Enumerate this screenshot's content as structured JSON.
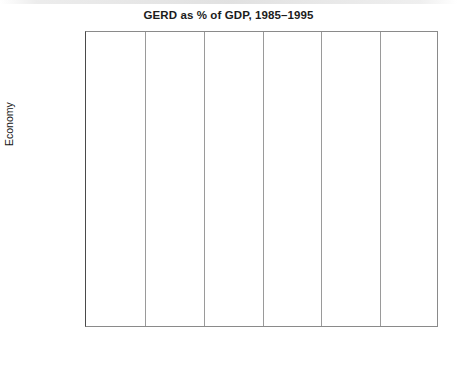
{
  "chart_data": {
    "type": "bar",
    "orientation": "horizontal",
    "title": "GERD as % of GDP, 1985–1995",
    "xlabel": "",
    "ylabel": "Economy",
    "xlim": [
      0,
      3
    ],
    "xticks": [
      0,
      0.5,
      1,
      1.5,
      2,
      2.5,
      3
    ],
    "xtick_labels": [
      "0",
      "0.5",
      "1",
      "1.5",
      "2",
      "2.5",
      "3"
    ],
    "grid": "vertical",
    "legend": "none",
    "categories": [
      "Japan",
      "Korea",
      "US",
      "UK",
      "Israel",
      "Chinese\nTaipei",
      "Australia",
      "Singapore",
      "New\nZealand",
      "India",
      "China",
      "Malaysia",
      "Hong Kong",
      "Philippines",
      "Thailand",
      "Indonesia"
    ],
    "values": [
      2.9,
      2.85,
      2.5,
      2.23,
      2.23,
      1.94,
      1.72,
      1.09,
      1.1,
      0.81,
      0.5,
      0.39,
      0.3,
      0.2,
      0.08,
      0.09
    ],
    "bar_color": "#6d6d6d",
    "bar_edge_color": "#2f2f2f",
    "plot_border_color": "#8a8a8a",
    "grid_color": "#9a9a9a"
  }
}
